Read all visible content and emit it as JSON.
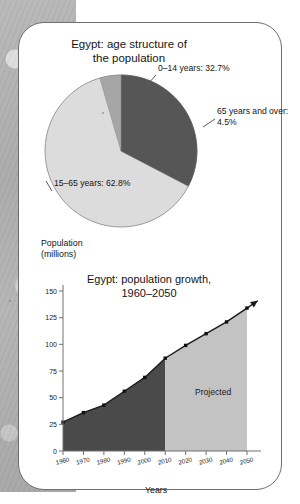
{
  "figure": {
    "background_color": "#ffffff",
    "card_border_color": "#6e6e6e",
    "margin_strip_color": "#ababab"
  },
  "pie": {
    "title_line1": "Egypt: age structure of",
    "title_line2": "the population",
    "labels": {
      "young": "0–14 years: 32.7%",
      "old_line1": "65 years and over:",
      "old_line2": "4.5%",
      "working": "15–65 years: 62.8%"
    }
  },
  "line": {
    "y_axis_caption_line1": "Population",
    "y_axis_caption_line2": "(millions)",
    "title_line1": "Egypt: population growth,",
    "title_line2": "1960–2050",
    "x_axis_label": "Years",
    "projected_label": "Projected"
  },
  "chart_data": [
    {
      "type": "pie",
      "title": "Egypt: age structure of the population",
      "categories": [
        "0–14 years",
        "15–65 years",
        "65 years and over"
      ],
      "values": [
        32.7,
        62.8,
        4.5
      ],
      "unit": "%",
      "colors": [
        "#5a5a5a",
        "#d9d9d9",
        "#a8a8a8"
      ],
      "labels": [
        "0–14 years: 32.7%",
        "15–65 years: 62.8%",
        "65 years and over: 4.5%"
      ],
      "start_angle_deg": 0,
      "direction": "clockwise",
      "legend": "none (direct labels with leader lines)"
    },
    {
      "type": "area",
      "title": "Egypt: population growth, 1960–2050",
      "xlabel": "Years",
      "ylabel": "Population (millions)",
      "xlim": [
        1960,
        2050
      ],
      "ylim": [
        0,
        150
      ],
      "ytick_labels": [
        "0",
        "25",
        "50",
        "75",
        "100",
        "125",
        "150"
      ],
      "yticks": [
        0,
        25,
        50,
        75,
        100,
        125,
        150
      ],
      "xtick_labels": [
        "1960",
        "1970",
        "1980",
        "1990",
        "2000",
        "2010",
        "2020",
        "2030",
        "2040",
        "2050"
      ],
      "xticks": [
        1960,
        1970,
        1980,
        1990,
        2000,
        2010,
        2020,
        2030,
        2040,
        2050
      ],
      "grid": false,
      "x": [
        1960,
        1970,
        1980,
        1990,
        2000,
        2010,
        2020,
        2030,
        2040,
        2050
      ],
      "values": [
        27,
        36,
        43,
        56,
        69,
        87,
        99,
        110,
        121,
        134
      ],
      "series": [
        {
          "name": "Population (millions)",
          "values": [
            27,
            36,
            43,
            56,
            69,
            87,
            99,
            110,
            121,
            134
          ]
        }
      ],
      "segments": [
        {
          "name": "Observed",
          "x_range": [
            1960,
            2010
          ],
          "fill": "#4a4a4a"
        },
        {
          "name": "Projected",
          "x_range": [
            2010,
            2050
          ],
          "fill": "#c3c3c3"
        }
      ],
      "annotations": [
        {
          "text": "Projected",
          "x": 2030,
          "y": 55
        }
      ],
      "line_color": "#1a1a1a",
      "marker": "square",
      "arrow_at_end": true
    }
  ]
}
